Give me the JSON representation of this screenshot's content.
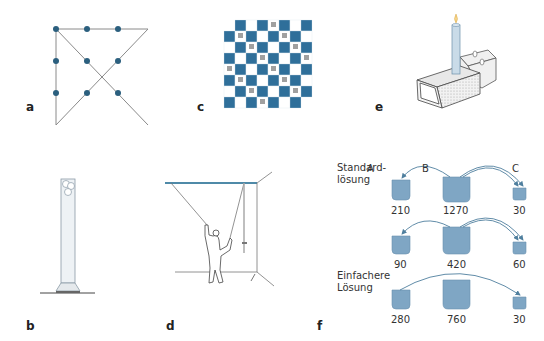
{
  "figure": {
    "panels": [
      {
        "id": "a",
        "label": "a",
        "name": "nine-dot-problem"
      },
      {
        "id": "b",
        "label": "b",
        "name": "tube-with-balls"
      },
      {
        "id": "c",
        "label": "c",
        "name": "mutilated-checkerboard"
      },
      {
        "id": "d",
        "label": "d",
        "name": "two-string-problem"
      },
      {
        "id": "e",
        "label": "e",
        "name": "candle-problem"
      },
      {
        "id": "f",
        "label": "f",
        "name": "water-jug-problem"
      }
    ],
    "colors": {
      "accent_blue": "#2f6f9a",
      "dot_blue": "#2b5f7e",
      "jug_fill": "#7fa6c4",
      "arrow": "#4f7f9e",
      "line_gray": "#8a8a8a",
      "square_gray": "#a0a0a0"
    }
  },
  "panel_f": {
    "column_labels": [
      "A",
      "B",
      "C"
    ],
    "rows": [
      {
        "label_line1": "Standard-",
        "label_line2": "lösung",
        "values": [
          "210",
          "1270",
          "30"
        ]
      },
      {
        "label_line1": "",
        "label_line2": "",
        "values": [
          "90",
          "420",
          "60"
        ]
      },
      {
        "label_line1": "Einfachere",
        "label_line2": "Lösung",
        "values": [
          "280",
          "760",
          "30"
        ]
      }
    ]
  }
}
